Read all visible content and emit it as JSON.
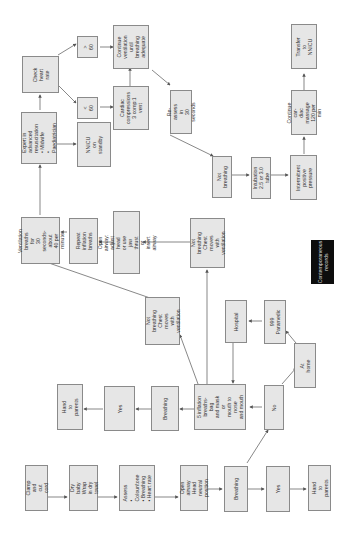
{
  "diagram": {
    "orientation": "rotated 90deg counter-clockwise",
    "colors": {
      "box_fill": "#e6e6e6",
      "box_border": "#8a8a8a",
      "arrow": "#555555",
      "note_fill": "#0d0d0d",
      "note_text": "#dddddd"
    },
    "nodes": {
      "clamp": "Clamp and cut\ncord",
      "dry": "Dry baby\nWrap in dry\ntowel",
      "assess": "Assess\n• Colour/tone\n• Breathing\n• Heart rate",
      "airway": "Open airway\nHead neutral\nposition",
      "breathing1": "Breathing",
      "yes1": "Yes",
      "hand1": "Hand to\nparents",
      "no": "No",
      "at_home": "At home",
      "paramedic": "999\nParamedic",
      "hospital": "Hospital",
      "inflation": "5 inflation\nbreaths-bag\nand mask or\nmouth to nose\nand mouth",
      "breathing2": "Breathing",
      "yes2": "Yes",
      "hand2": "Hand to\nparents",
      "not_breathing_chest": "Not breathing\nChest moves\nwith ventilation",
      "not_breathing_chest2": "Not breathing\nChest moves\nwith ventilation",
      "open_airway_adjust": "Open airway: adjust\nhead or use jaw\nthrust or insert airway",
      "repeat": "Repeat\ninflation\nbreaths",
      "ventilation": "Ventilation\nbreaths for\n30 seconds-about\n40 per minute",
      "expert": "Expert in advanced\nresuscitation\n• Midwife\n• Paediatrician",
      "nnicu_standby": "NNICU on\nstandby",
      "check_hr": "Check heart\nrate",
      "lt60": "< 60",
      "gt60": "> 60",
      "cardiac": "Cardiac\ncompressions\n3 comp:1\nvent",
      "continue_vent": "Continue\nventilation\nuntil breathing\nadequate",
      "reassess": "Re-assess in\n30 seconds",
      "not_breathing3": "Not\nbreathing",
      "intubation": "Intubation\n2.5 or 3.0 tube",
      "ippv": "Intermittent\npositive\npressure",
      "continue_cardiac": "Continue car-\ndiac massage\n120 per min",
      "transfer": "Transfer to\nNNICU"
    },
    "note": "Contemporaneous\nrecords"
  }
}
